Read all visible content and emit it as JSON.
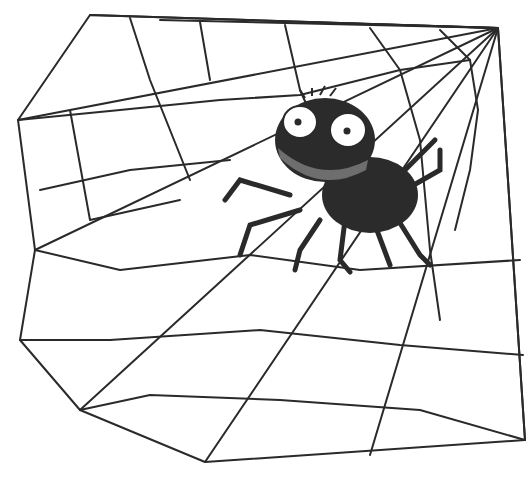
{
  "image": {
    "subject": "cartoon spider on a web",
    "width": 528,
    "height": 481,
    "colors": {
      "background": "#ffffff",
      "ink": "#2a2a2a",
      "spider_body": "#2b2b2b",
      "spider_mouth": "#6e6e6e",
      "eye_white": "#ffffff"
    }
  }
}
